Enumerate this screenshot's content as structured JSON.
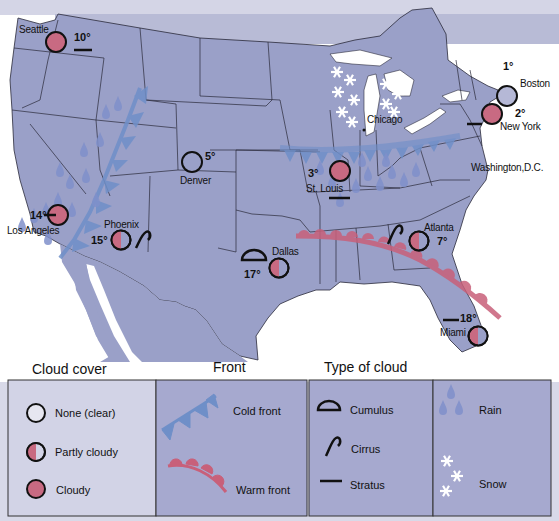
{
  "colors": {
    "land": "#9aa0c8",
    "canada": "#b8bbd6",
    "ocean": "#ffffff",
    "border": "#2a2a3a",
    "cloud_fill": "#c86a82",
    "cold_front": "#6f8fc8",
    "warm_front": "#c8607a",
    "rain": "#7f8fca",
    "snow": "#ffffff",
    "legend_bg": "#a6a9cf"
  },
  "cities": [
    {
      "name": "Seattle",
      "temp": "10°",
      "cover": "cloudy",
      "cloud_type": "stratus"
    },
    {
      "name": "Boston",
      "temp": "1°",
      "cover": "clear",
      "cloud_type": ""
    },
    {
      "name": "New York",
      "temp": "2°",
      "cover": "cloudy",
      "cloud_type": "stratus"
    },
    {
      "name": "Chicago",
      "temp": "",
      "cover": "",
      "cloud_type": "",
      "weather": "snow"
    },
    {
      "name": "Washington,D.C.",
      "temp": "",
      "cover": "",
      "cloud_type": ""
    },
    {
      "name": "St. Louis",
      "temp": "3°",
      "cover": "cloudy",
      "cloud_type": "stratus",
      "weather": "rain"
    },
    {
      "name": "Denver",
      "temp": "5°",
      "cover": "clear",
      "cloud_type": ""
    },
    {
      "name": "Los Angeles",
      "temp": "14°",
      "cover": "cloudy",
      "cloud_type": "stratus",
      "weather": "rain"
    },
    {
      "name": "Phoenix",
      "temp": "15°",
      "cover": "partly_cloudy",
      "cloud_type": "cirrus"
    },
    {
      "name": "Dallas",
      "temp": "17°",
      "cover": "partly_cloudy",
      "cloud_type": "cumulus"
    },
    {
      "name": "Atlanta",
      "temp": "7°",
      "cover": "partly_cloudy",
      "cloud_type": "cirrus"
    },
    {
      "name": "Miami",
      "temp": "18°",
      "cover": "partly_cloudy",
      "cloud_type": "stratus"
    }
  ],
  "legend": {
    "cloud_cover": {
      "title": "Cloud cover",
      "items": [
        {
          "icon": "clear-circle-icon",
          "label": "None (clear)"
        },
        {
          "icon": "partly-cloudy-circle-icon",
          "label": "Partly cloudy"
        },
        {
          "icon": "cloudy-circle-icon",
          "label": "Cloudy"
        }
      ]
    },
    "front": {
      "title": "Front",
      "items": [
        {
          "icon": "cold-front-icon",
          "label": "Cold front"
        },
        {
          "icon": "warm-front-icon",
          "label": "Warm front"
        }
      ]
    },
    "type_of_cloud": {
      "title": "Type of cloud",
      "items": [
        {
          "icon": "cumulus-icon",
          "label": "Cumulus"
        },
        {
          "icon": "cirrus-icon",
          "label": "Cirrus"
        },
        {
          "icon": "stratus-icon",
          "label": "Stratus"
        }
      ]
    },
    "precipitation": {
      "items": [
        {
          "icon": "rain-drops-icon",
          "label": "Rain"
        },
        {
          "icon": "snowflakes-icon",
          "label": "Snow"
        }
      ]
    }
  }
}
